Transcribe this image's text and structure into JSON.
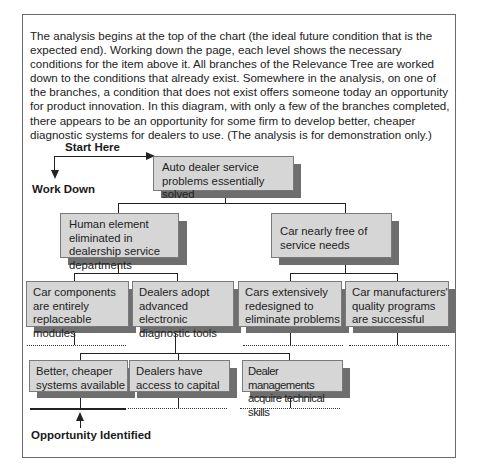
{
  "intro": {
    "paragraph": "The analysis begins at the top of the chart (the ideal future condition that is the expected end).  Working down the page, each level shows the necessary conditions for the item above it.  All branches of the Relevance Tree are worked down to the conditions that already exist.  Somewhere in the analysis, on one of the branches, a condition that does not exist offers someone today an opportunity for product innovation.  In this diagram, with only a few of the branches completed, there appears to be an opportunity for some firm to develop better, cheaper diagnostic systems for dealers to use.  (The analysis is for demonstration only.)"
  },
  "annotations": {
    "start_here": "Start Here",
    "work_down": "Work Down",
    "opportunity_identified": "Opportunity Identified"
  },
  "tree": {
    "root": {
      "label": "Auto dealer service problems essentially solved"
    },
    "level2": [
      {
        "label": "Human element eliminated in dealership service departments"
      },
      {
        "label": "Car nearly free of service needs"
      }
    ],
    "level3": [
      {
        "label": "Car components are entirely replaceable modules"
      },
      {
        "label": "Dealers adopt advanced electronic diagnostic tools"
      },
      {
        "label": "Cars extensively redesigned to eliminate problems"
      },
      {
        "label": "Car manufacturers' quality programs are successful"
      }
    ],
    "level4": [
      {
        "label": "Better, cheaper systems available"
      },
      {
        "label": "Dealers have access to capital"
      },
      {
        "label": "Dealer managements acquire technical skills"
      }
    ]
  },
  "colors": {
    "box_fill": "#d6d6d6",
    "box_shadow": "#6e6e6e",
    "line": "#222222"
  }
}
